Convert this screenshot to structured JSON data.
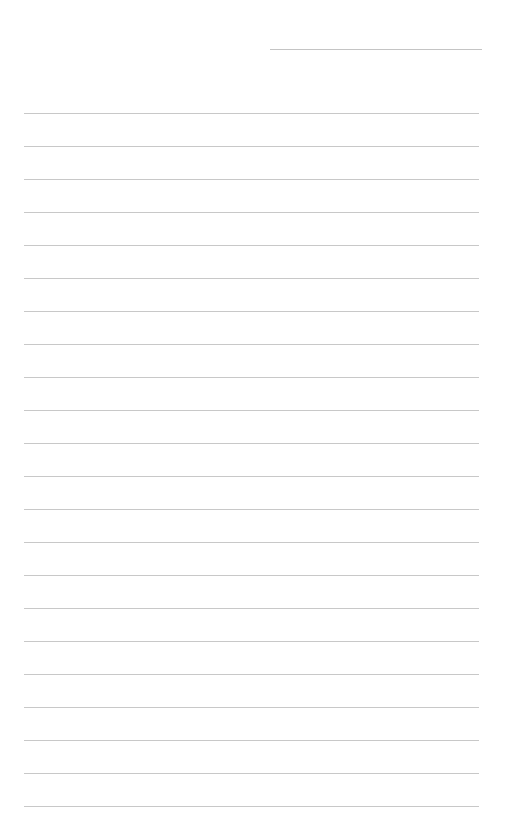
{
  "page": {
    "type": "lined-paper",
    "background": "#ffffff",
    "line_color": "#c8c8c8",
    "header_line": {
      "left": 270,
      "top": 49,
      "width": 212
    },
    "rules": {
      "left": 24,
      "width": 455,
      "first_top": 113,
      "spacing": 33,
      "count": 22
    }
  }
}
